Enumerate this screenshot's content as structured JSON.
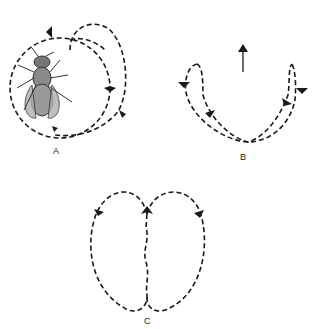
{
  "figure": {
    "panels": [
      {
        "id": "A",
        "label": "A",
        "description": "Fly with circular dashed flight path and arrows"
      },
      {
        "id": "B",
        "label": "B",
        "description": "U-shaped dashed path with two end loops and upward arrow"
      },
      {
        "id": "C",
        "label": "C",
        "description": "Figure-eight dashed path with wavy center line"
      }
    ],
    "colors": {
      "stroke": "#1a1a1a",
      "fly_body": "#9a9a9a",
      "background": "#ffffff"
    }
  }
}
